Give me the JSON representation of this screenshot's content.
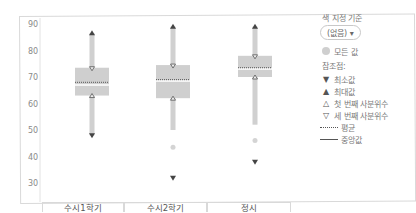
{
  "chart_data": {
    "type": "box",
    "title": "",
    "xlabel": "",
    "ylabel": "",
    "ylim": [
      30,
      90
    ],
    "y_ticks": [
      90,
      80,
      70,
      60,
      50,
      40,
      30
    ],
    "grid": false,
    "legend_position": "right",
    "categories": [
      "수시1학기",
      "수시2학기",
      "정시"
    ],
    "series": [
      {
        "name": "수시1학기",
        "max": 86.5,
        "q3": 73.5,
        "mean": 68,
        "median": 67,
        "q1": 63,
        "whisker_low": 48,
        "min": 48,
        "outliers": []
      },
      {
        "name": "수시2학기",
        "max": 89,
        "q3": 74.5,
        "mean": 69,
        "median": 68.5,
        "q1": 62,
        "whisker_low": 50,
        "min": 32,
        "outliers": [
          43.5
        ]
      },
      {
        "name": "정시",
        "max": 89,
        "q3": 78,
        "mean": 73.5,
        "median": 73,
        "q1": 70,
        "whisker_low": 52,
        "min": 38,
        "outliers": [
          46
        ]
      }
    ],
    "colors": {
      "box": "#cfcfcf",
      "whisker": "#d0d0d0",
      "marker": "#444444",
      "axis_text": "#8a8a8a"
    }
  },
  "legend": {
    "title": "색 지정 기준",
    "dropdown": "(없음)",
    "dropdown_arrow": "▾",
    "all_values": "모든 값",
    "reference_title": "참조점:",
    "items": [
      {
        "symbol": "▼",
        "label": "최소값"
      },
      {
        "symbol": "▲",
        "label": "최대값"
      },
      {
        "symbol": "△",
        "label": "첫 번째 사분위수"
      },
      {
        "symbol": "▽",
        "label": "세 번째 사분위수"
      }
    ],
    "mean_label": "평균",
    "median_label": "중앙값"
  },
  "axis": {
    "y_labels": [
      "90",
      "80",
      "70",
      "60",
      "50",
      "40",
      "30"
    ],
    "x_labels": [
      "수시1학기",
      "수시2학기",
      "정시"
    ]
  }
}
